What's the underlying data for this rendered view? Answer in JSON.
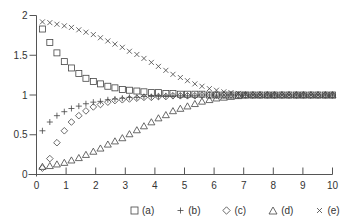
{
  "chart_data": {
    "type": "scatter",
    "title": "",
    "xlabel": "",
    "ylabel": "",
    "xlim": [
      0,
      10
    ],
    "ylim": [
      0,
      2
    ],
    "x_ticks": [
      0,
      1,
      2,
      3,
      4,
      5,
      6,
      7,
      8,
      9,
      10
    ],
    "y_ticks": [
      0,
      0.5,
      1,
      1.5,
      2
    ],
    "y_tick_labels": [
      "0",
      "0.5",
      "1",
      "1.5",
      "2"
    ],
    "grid": false,
    "legend_position": "bottom-right",
    "x": [
      0.2,
      0.45,
      0.69,
      0.94,
      1.18,
      1.43,
      1.67,
      1.92,
      2.16,
      2.41,
      2.65,
      2.9,
      3.14,
      3.39,
      3.63,
      3.88,
      4.12,
      4.37,
      4.61,
      4.86,
      5.1,
      5.35,
      5.59,
      5.84,
      6.08,
      6.33,
      6.57,
      6.82,
      7.06,
      7.31,
      7.55,
      7.8,
      8.04,
      8.29,
      8.53,
      8.78,
      9.02,
      9.27,
      9.51,
      9.76,
      10.0
    ],
    "series": [
      {
        "name": "(a)",
        "marker": "square",
        "values": [
          1.83,
          1.66,
          1.53,
          1.42,
          1.34,
          1.27,
          1.21,
          1.17,
          1.14,
          1.11,
          1.09,
          1.07,
          1.06,
          1.05,
          1.04,
          1.03,
          1.03,
          1.02,
          1.02,
          1.01,
          1.01,
          1.01,
          1.01,
          1.0,
          1.0,
          1.0,
          1.0,
          1.0,
          1.0,
          1.0,
          1.0,
          1.0,
          1.0,
          1.0,
          1.0,
          1.0,
          1.0,
          1.0,
          1.0,
          1.0,
          1.0
        ]
      },
      {
        "name": "(b)",
        "marker": "plus",
        "values": [
          0.55,
          0.66,
          0.74,
          0.79,
          0.83,
          0.86,
          0.89,
          0.91,
          0.92,
          0.94,
          0.95,
          0.96,
          0.97,
          0.97,
          0.98,
          0.98,
          0.98,
          0.99,
          0.99,
          0.99,
          0.99,
          0.99,
          1.0,
          1.0,
          1.0,
          1.0,
          1.0,
          1.0,
          1.0,
          1.0,
          1.0,
          1.0,
          1.0,
          1.0,
          1.0,
          1.0,
          1.0,
          1.0,
          1.0,
          1.0,
          1.0
        ]
      },
      {
        "name": "(c)",
        "marker": "diamond",
        "values": [
          0.08,
          0.2,
          0.4,
          0.55,
          0.66,
          0.74,
          0.8,
          0.85,
          0.88,
          0.91,
          0.93,
          0.94,
          0.95,
          0.96,
          0.97,
          0.97,
          0.98,
          0.98,
          0.99,
          0.99,
          0.99,
          0.99,
          1.0,
          1.0,
          1.0,
          1.0,
          1.0,
          1.0,
          1.0,
          1.0,
          1.0,
          1.0,
          1.0,
          1.0,
          1.0,
          1.0,
          1.0,
          1.0,
          1.0,
          1.0,
          1.0
        ]
      },
      {
        "name": "(d)",
        "marker": "triangle",
        "values": [
          0.1,
          0.11,
          0.13,
          0.15,
          0.18,
          0.21,
          0.25,
          0.29,
          0.33,
          0.38,
          0.42,
          0.46,
          0.51,
          0.56,
          0.61,
          0.66,
          0.71,
          0.75,
          0.8,
          0.83,
          0.86,
          0.89,
          0.92,
          0.94,
          0.96,
          0.97,
          0.98,
          0.99,
          1.0,
          1.0,
          1.0,
          1.0,
          1.0,
          1.0,
          1.0,
          1.0,
          1.0,
          1.0,
          1.0,
          1.0,
          1.0
        ]
      },
      {
        "name": "(e)",
        "marker": "cross",
        "values": [
          1.92,
          1.91,
          1.89,
          1.87,
          1.85,
          1.82,
          1.79,
          1.76,
          1.72,
          1.68,
          1.64,
          1.6,
          1.55,
          1.51,
          1.46,
          1.41,
          1.36,
          1.31,
          1.26,
          1.22,
          1.18,
          1.14,
          1.11,
          1.08,
          1.06,
          1.04,
          1.03,
          1.02,
          1.01,
          1.0,
          1.0,
          1.0,
          1.0,
          1.0,
          1.0,
          1.0,
          1.0,
          1.0,
          1.0,
          1.0,
          1.0
        ]
      }
    ]
  },
  "legend": {
    "items": [
      {
        "symbol": "square",
        "label": "(a)"
      },
      {
        "symbol": "plus",
        "label": "(b)"
      },
      {
        "symbol": "diamond",
        "label": "(c)"
      },
      {
        "symbol": "triangle",
        "label": "(d)"
      },
      {
        "symbol": "cross",
        "label": "(e)"
      }
    ]
  },
  "colors": {
    "axis": "#555555",
    "marker": "#444444",
    "text": "#333333"
  }
}
